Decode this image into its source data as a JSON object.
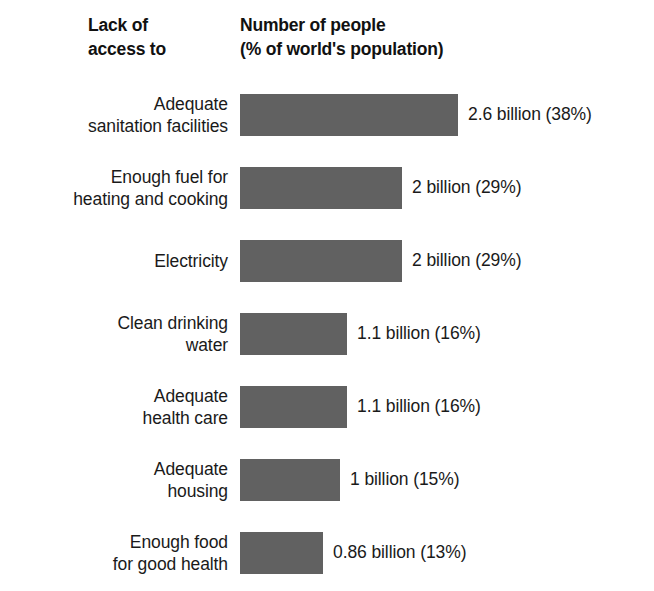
{
  "header": {
    "left_col_line1": "Lack of",
    "left_col_line2": "access to",
    "right_col_line1": "Number of people",
    "right_col_line2": "(% of world's population)"
  },
  "style": {
    "bar_color": "#616161",
    "background_color": "#ffffff",
    "text_color": "#1a1a1a"
  },
  "chart_data": {
    "type": "bar",
    "orientation": "horizontal",
    "title": "Number of people (% of world's population)",
    "xlabel": "",
    "ylabel": "Lack of access to",
    "grid": false,
    "legend": "none",
    "xlim": [
      0,
      2.6
    ],
    "unit": "billion people",
    "categories": [
      "Adequate sanitation facilities",
      "Enough fuel for heating and cooking",
      "Electricity",
      "Clean drinking water",
      "Adequate health care",
      "Adequate housing",
      "Enough food for good health"
    ],
    "values": [
      2.6,
      2,
      2,
      1.1,
      1.1,
      1,
      0.86
    ],
    "percentages": [
      38,
      29,
      29,
      16,
      16,
      15,
      13
    ],
    "value_labels": [
      "2.6 billion (38%)",
      "2 billion (29%)",
      "2 billion (29%)",
      "1.1 billion (16%)",
      "1.1 billion (16%)",
      "1 billion (15%)",
      "0.86 billion (13%)"
    ]
  },
  "rows": [
    {
      "label_line1": "Adequate",
      "label_line2": "sanitation facilities",
      "value_label": "2.6 billion (38%)",
      "bar_width_px": 218
    },
    {
      "label_line1": "Enough fuel for",
      "label_line2": "heating and cooking",
      "value_label": "2 billion (29%)",
      "bar_width_px": 162
    },
    {
      "label_line1": "Electricity",
      "label_line2": "",
      "value_label": "2 billion (29%)",
      "bar_width_px": 162
    },
    {
      "label_line1": "Clean drinking",
      "label_line2": "water",
      "value_label": "1.1 billion (16%)",
      "bar_width_px": 107
    },
    {
      "label_line1": "Adequate",
      "label_line2": "health care",
      "value_label": "1.1 billion (16%)",
      "bar_width_px": 107
    },
    {
      "label_line1": "Adequate",
      "label_line2": "housing",
      "value_label": "1 billion (15%)",
      "bar_width_px": 100
    },
    {
      "label_line1": "Enough food",
      "label_line2": "for good health",
      "value_label": "0.86 billion (13%)",
      "bar_width_px": 83
    }
  ]
}
